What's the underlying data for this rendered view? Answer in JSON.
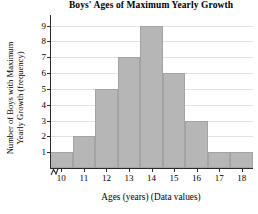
{
  "chart_data": {
    "type": "bar",
    "title": "Boys' Ages of Maximum Yearly Growth",
    "xlabel": "Ages (years) (Data values)",
    "ylabel_line1": "Number of Boys with Maximum",
    "ylabel_line2": "Yearly Growth (frequency)",
    "categories": [
      10,
      11,
      12,
      13,
      14,
      15,
      16,
      17,
      18
    ],
    "values": [
      1,
      2,
      5,
      7,
      9,
      6,
      3,
      1,
      1
    ],
    "xtick_labels": [
      "10",
      "11",
      "12",
      "13",
      "14",
      "15",
      "16",
      "17",
      "18"
    ],
    "ytick_labels": [
      "1",
      "2",
      "3",
      "4",
      "5",
      "6",
      "7",
      "8",
      "9"
    ],
    "ytick_values": [
      1,
      2,
      3,
      4,
      5,
      6,
      7,
      8,
      9
    ],
    "ylim": [
      0,
      9.6
    ],
    "xlim": [
      9.5,
      18.5
    ],
    "grid": "horizontal",
    "legend": "none",
    "bar_fill_color": "#b6b6b6",
    "bar_edge_color": "#a3a3a3",
    "gridline_color": "#e2e2e2",
    "axis_color": "#2a2a2a",
    "background_color": "#ffffff",
    "axis_break": "x-axis-break-zigzag"
  }
}
